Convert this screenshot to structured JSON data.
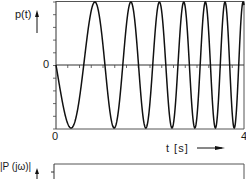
{
  "chart_data": [
    {
      "type": "line",
      "title": "",
      "xlabel": "t [s]",
      "ylabel": "p(t)",
      "xlim": [
        0,
        4
      ],
      "ylim": [
        -1,
        1
      ],
      "x_tick_labels": [
        "0",
        "4"
      ],
      "y_tick_labels": [
        "0"
      ],
      "grid": false,
      "legend": null,
      "description": "Linear chirp signal: constant amplitude, frequency increasing with time, starts at 0 going negative",
      "signal": {
        "form": "-sin(2*pi*(f0*t + k*t^2/2))",
        "f0_hz": 0.7,
        "k_hz_per_s": 0.5,
        "amplitude": 1
      },
      "extrema_t": {
        "minima": [
          0.3,
          1.34,
          2.15,
          2.83,
          3.32,
          3.72
        ],
        "maxima": [
          0.87,
          1.77,
          2.53,
          3.11,
          3.55,
          3.91
        ]
      }
    },
    {
      "type": "line",
      "title": "",
      "ylabel": "|P(jω)|",
      "description": "Magnitude spectrum panel (only top portion visible)"
    }
  ],
  "labels": {
    "p_axis": "p(t)",
    "zero_y": "0",
    "zero_x": "0",
    "t_end": "4",
    "t_axis": "t [s]",
    "P_axis": "|P (jω)|"
  }
}
